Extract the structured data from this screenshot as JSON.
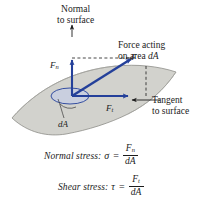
{
  "figure": {
    "colors": {
      "surface_fill": "#d2d2cd",
      "surface_edge": "#8d8d88",
      "vector_blue": "#24409a",
      "annotation_black": "#1b1b1b",
      "ellipse_fill": "#c5cde4",
      "background": "#ffffff"
    },
    "annotations": {
      "normal_line1": "Normal",
      "normal_line2": "to surface",
      "force_line1": "Force acting",
      "force_line2_prefix": "on area ",
      "force_line2_area": "dA",
      "tangent_line1": "Tangent",
      "tangent_line2": "to surface",
      "area_label": "dA"
    },
    "vectors": {
      "resultant": {
        "symbol": "F",
        "subscript": ""
      },
      "normal_component": {
        "symbol": "F",
        "subscript": "n"
      },
      "tangential_component": {
        "symbol": "F",
        "subscript": "t"
      }
    },
    "equations": [
      {
        "name": "Normal stress:",
        "symbol": "σ",
        "equals": "=",
        "numerator": "F",
        "numerator_sub": "n",
        "denominator": "dA"
      },
      {
        "name": "Shear stress:",
        "symbol": "τ",
        "equals": "=",
        "numerator": "F",
        "numerator_sub": "t",
        "denominator": "dA"
      }
    ]
  }
}
